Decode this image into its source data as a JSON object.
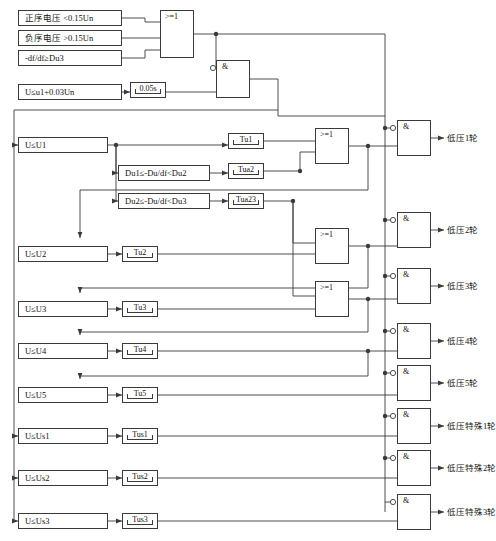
{
  "diagram": {
    "inputs": [
      {
        "id": "pos-seq",
        "label": "正序电压 <0.15Un",
        "x": 18,
        "y": 10,
        "w": 104,
        "h": 16
      },
      {
        "id": "neg-seq",
        "label": "负序电压 >0.15Un",
        "x": 18,
        "y": 30,
        "w": 104,
        "h": 16
      },
      {
        "id": "dfdt",
        "label": "-df/df≥Du3",
        "x": 18,
        "y": 50,
        "w": 104,
        "h": 16
      },
      {
        "id": "u-u1-003",
        "label": "U≤u1+0.03Un",
        "x": 18,
        "y": 84,
        "w": 104,
        "h": 16
      }
    ],
    "conditions": [
      {
        "id": "u-le-u1",
        "label": "U≤U1",
        "x": 18,
        "y": 137,
        "w": 90,
        "h": 16
      },
      {
        "id": "du1-du2",
        "label": "Du1≤-Du/df<Du2",
        "x": 118,
        "y": 165,
        "w": 92,
        "h": 16
      },
      {
        "id": "du2-du3",
        "label": "Du2≤-Du/df<Du3",
        "x": 118,
        "y": 193,
        "w": 92,
        "h": 16
      },
      {
        "id": "u-le-u2",
        "label": "U≤U2",
        "x": 18,
        "y": 246,
        "w": 90,
        "h": 16
      },
      {
        "id": "u-le-u3",
        "label": "U≤U3",
        "x": 18,
        "y": 301,
        "w": 90,
        "h": 16
      },
      {
        "id": "u-le-u4",
        "label": "U≤U4",
        "x": 18,
        "y": 343,
        "w": 90,
        "h": 16
      },
      {
        "id": "u-le-u5",
        "label": "U≤U5",
        "x": 18,
        "y": 387,
        "w": 90,
        "h": 16
      },
      {
        "id": "u-le-us1",
        "label": "U≤Us1",
        "x": 18,
        "y": 428,
        "w": 90,
        "h": 16
      },
      {
        "id": "u-le-us2",
        "label": "U≤Us2",
        "x": 18,
        "y": 470,
        "w": 90,
        "h": 16
      },
      {
        "id": "u-le-us3",
        "label": "U≤Us3",
        "x": 18,
        "y": 513,
        "w": 90,
        "h": 16
      }
    ],
    "timers": [
      {
        "id": "t-005",
        "label": "0.05s",
        "x": 130,
        "y": 82,
        "w": 36,
        "h": 16
      },
      {
        "id": "t-tu1",
        "label": "Tu1",
        "x": 228,
        "y": 133,
        "w": 36,
        "h": 16
      },
      {
        "id": "t-tua2",
        "label": "Tua2",
        "x": 228,
        "y": 163,
        "w": 36,
        "h": 16
      },
      {
        "id": "t-tua23",
        "label": "Tua23",
        "x": 228,
        "y": 193,
        "w": 36,
        "h": 16
      },
      {
        "id": "t-tu2",
        "label": "Tu2",
        "x": 122,
        "y": 246,
        "w": 36,
        "h": 16
      },
      {
        "id": "t-tu3",
        "label": "Tu3",
        "x": 122,
        "y": 301,
        "w": 36,
        "h": 16
      },
      {
        "id": "t-tu4",
        "label": "Tu4",
        "x": 122,
        "y": 343,
        "w": 36,
        "h": 16
      },
      {
        "id": "t-tu5",
        "label": "Tu5",
        "x": 122,
        "y": 387,
        "w": 36,
        "h": 16
      },
      {
        "id": "t-tus1",
        "label": "Tus1",
        "x": 122,
        "y": 428,
        "w": 36,
        "h": 16
      },
      {
        "id": "t-tus2",
        "label": "Tus2",
        "x": 122,
        "y": 470,
        "w": 36,
        "h": 16
      },
      {
        "id": "t-tus3",
        "label": "Tus3",
        "x": 122,
        "y": 513,
        "w": 36,
        "h": 16
      }
    ],
    "or_gates": [
      {
        "id": "or-top",
        "label": ">=1",
        "x": 160,
        "y": 10,
        "w": 34,
        "h": 48
      },
      {
        "id": "or-1",
        "label": ">=1",
        "x": 315,
        "y": 128,
        "w": 34,
        "h": 36
      },
      {
        "id": "or-2",
        "label": ">=1",
        "x": 315,
        "y": 228,
        "w": 34,
        "h": 36
      },
      {
        "id": "or-3",
        "label": ">=1",
        "x": 315,
        "y": 281,
        "w": 34,
        "h": 36
      }
    ],
    "and_gates": [
      {
        "id": "and-top",
        "label": "&",
        "x": 216,
        "y": 60,
        "w": 34,
        "h": 38
      },
      {
        "id": "and-1",
        "label": "&",
        "x": 397,
        "y": 120,
        "w": 34,
        "h": 36
      },
      {
        "id": "and-2",
        "label": "&",
        "x": 397,
        "y": 212,
        "w": 34,
        "h": 36
      },
      {
        "id": "and-3",
        "label": "&",
        "x": 397,
        "y": 268,
        "w": 34,
        "h": 36
      },
      {
        "id": "and-4",
        "label": "&",
        "x": 397,
        "y": 323,
        "w": 34,
        "h": 36
      },
      {
        "id": "and-5",
        "label": "&",
        "x": 397,
        "y": 365,
        "w": 34,
        "h": 36
      },
      {
        "id": "and-6",
        "label": "&",
        "x": 397,
        "y": 408,
        "w": 34,
        "h": 36
      },
      {
        "id": "and-7",
        "label": "&",
        "x": 397,
        "y": 450,
        "w": 34,
        "h": 36
      },
      {
        "id": "and-8",
        "label": "&",
        "x": 397,
        "y": 494,
        "w": 34,
        "h": 36
      }
    ],
    "outputs": [
      {
        "id": "out-1",
        "label": "低压1轮",
        "x": 447,
        "y": 134
      },
      {
        "id": "out-2",
        "label": "低压2轮",
        "x": 447,
        "y": 226
      },
      {
        "id": "out-3",
        "label": "低压3轮",
        "x": 447,
        "y": 282
      },
      {
        "id": "out-4",
        "label": "低压4轮",
        "x": 447,
        "y": 337
      },
      {
        "id": "out-5",
        "label": "低压5轮",
        "x": 447,
        "y": 379
      },
      {
        "id": "out-s1",
        "label": "低压特殊1轮",
        "x": 447,
        "y": 422
      },
      {
        "id": "out-s2",
        "label": "低压特殊2轮",
        "x": 447,
        "y": 464
      },
      {
        "id": "out-s3",
        "label": "低压特殊3轮",
        "x": 447,
        "y": 508
      }
    ],
    "colors": {
      "line": "#3a3a3a",
      "box_border": "#3a3a3a",
      "text": "#111111",
      "background": "#ffffff"
    }
  }
}
